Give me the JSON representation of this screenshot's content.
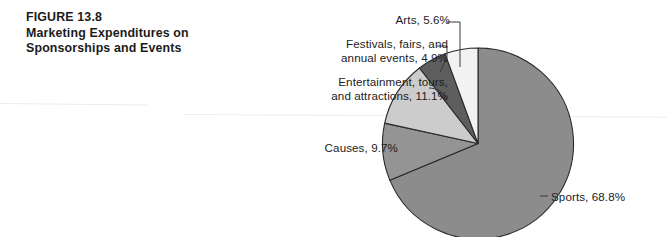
{
  "figure": {
    "number_label": "FIGURE 13.8",
    "title_line_1": "Marketing Expenditures on",
    "title_line_2": "Sponsorships and Events"
  },
  "chart_data": {
    "type": "pie",
    "title": "Marketing Expenditures on Sponsorships and Events",
    "subtitle": "FIGURE 13.8",
    "xlabel": "",
    "ylabel": "",
    "legend_position": "none",
    "grid": false,
    "labels_inline": true,
    "categories": [
      "Sports",
      "Causes",
      "Entertainment, tours, and attractions",
      "Festivals, fairs, and annual events",
      "Arts"
    ],
    "values": [
      68.8,
      9.7,
      11.1,
      4.9,
      5.6
    ],
    "units": "percent",
    "slices": [
      {
        "name": "Sports",
        "value": 68.8,
        "value_text": "68.8%",
        "label_text": "Sports, 68.8%",
        "color": "#8c8c8c"
      },
      {
        "name": "Causes",
        "value": 9.7,
        "value_text": "9.7%",
        "label_text": "Causes, 9.7%",
        "color": "#949494"
      },
      {
        "name": "Entertainment, tours, and attractions",
        "value": 11.1,
        "value_text": "11.1%",
        "label_text_line_1": "Entertainment, tours,",
        "label_text_line_2": "and attractions, 11.1%",
        "color": "#cccccc"
      },
      {
        "name": "Festivals, fairs, and annual events",
        "value": 4.9,
        "value_text": "4.9%",
        "label_text_line_1": "Festivals, fairs, and",
        "label_text_line_2": "annual events, 4.9%",
        "color": "#5e5e5e"
      },
      {
        "name": "Arts",
        "value": 5.6,
        "value_text": "5.6%",
        "label_text": "Arts, 5.6%",
        "color": "#f2f2f2"
      }
    ]
  },
  "colors": {
    "background": "#ffffff",
    "text": "#1c1c1c",
    "slice_outline": "#2a2a2a",
    "leader_line": "#3a3a3a"
  }
}
